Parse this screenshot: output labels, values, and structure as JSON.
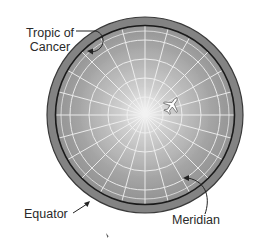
{
  "diagram": {
    "labels": {
      "tropic_line1": "Tropic of",
      "tropic_line2": "Cancer",
      "equator": "Equator",
      "meridian": "Meridian"
    },
    "icons": [
      "airplane-icon"
    ],
    "colors": {
      "globe_fill": "#9a9a9a",
      "globe_center": "#e8e8e8",
      "ring_outer": "#7f7f7f",
      "equator_line": "#1a1a1a",
      "grid_lines": "#f2f2f2",
      "arrows": "#222222",
      "text": "#2a2a2a"
    }
  }
}
